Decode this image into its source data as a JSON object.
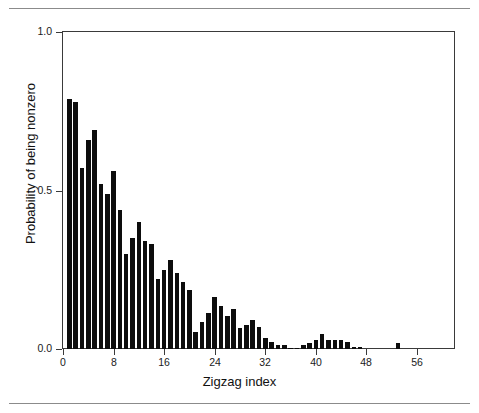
{
  "figure": {
    "background_color": "#ffffff",
    "frame_color": "#3a3a3a",
    "rule_color": "#8b8b8b",
    "bar_color": "#0d0d0d"
  },
  "chart_data": {
    "type": "bar",
    "title": "",
    "subtitle": "",
    "xlabel": "Zigzag index",
    "ylabel": "Probability of being nonzero",
    "xlim": [
      0,
      62
    ],
    "ylim": [
      0.0,
      1.0
    ],
    "grid": false,
    "legend": null,
    "xticks": [
      0,
      8,
      16,
      24,
      32,
      40,
      48,
      56
    ],
    "xtick_labels": [
      "0",
      "8",
      "16",
      "24",
      "32",
      "40",
      "48",
      "56"
    ],
    "yticks": [
      0.0,
      0.5,
      1.0
    ],
    "ytick_labels": [
      "0.0",
      "0.5",
      "1.0"
    ],
    "categories": [
      1,
      2,
      3,
      4,
      5,
      6,
      7,
      8,
      9,
      10,
      11,
      12,
      13,
      14,
      15,
      16,
      17,
      18,
      19,
      20,
      21,
      22,
      23,
      24,
      25,
      26,
      27,
      28,
      29,
      30,
      31,
      32,
      33,
      34,
      35,
      36,
      37,
      38,
      39,
      40,
      41,
      42,
      43,
      44,
      45,
      46,
      47,
      48,
      49,
      50,
      51,
      52,
      53,
      54,
      55,
      56,
      57,
      58
    ],
    "values": [
      0.79,
      0.78,
      0.57,
      0.66,
      0.69,
      0.52,
      0.49,
      0.56,
      0.44,
      0.3,
      0.35,
      0.4,
      0.34,
      0.33,
      0.22,
      0.25,
      0.28,
      0.24,
      0.21,
      0.185,
      0.055,
      0.085,
      0.115,
      0.165,
      0.135,
      0.105,
      0.125,
      0.065,
      0.075,
      0.09,
      0.07,
      0.035,
      0.022,
      0.012,
      0.012,
      0.004,
      0.004,
      0.014,
      0.018,
      0.03,
      0.047,
      0.029,
      0.028,
      0.027,
      0.021,
      0.006,
      0.005,
      0.0,
      0.0,
      0.0,
      0.0,
      0.0,
      0.018,
      0.0,
      0.0,
      0.0,
      0.0,
      0.0
    ]
  }
}
